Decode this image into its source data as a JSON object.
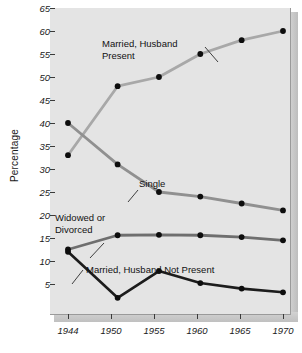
{
  "chart_data": {
    "type": "line",
    "title": "",
    "xlabel": "",
    "ylabel": "Percentage",
    "x": [
      1944,
      1950,
      1955,
      1960,
      1965,
      1970
    ],
    "xtick_labels": [
      "1944",
      "1950",
      "1955",
      "1960",
      "1965",
      "1970"
    ],
    "ytick_labels": [
      "5",
      "10",
      "15",
      "20",
      "25",
      "30",
      "35",
      "40",
      "45",
      "50",
      "55",
      "60",
      "65"
    ],
    "ylim": [
      0,
      65
    ],
    "xlim": [
      1942,
      1972
    ],
    "grid": false,
    "legend_position": "inline-annotations",
    "series": [
      {
        "name": "Married, Husband Present",
        "color": "#a8a8a8",
        "values": [
          33,
          48,
          50,
          55,
          58,
          60
        ]
      },
      {
        "name": "Single",
        "color": "#909090",
        "values": [
          40,
          31,
          25,
          24,
          22.5,
          21
        ]
      },
      {
        "name": "Widowed or Divorced",
        "color": "#6e6e6e",
        "values": [
          12.5,
          15.6,
          15.7,
          15.6,
          15.2,
          14.5
        ]
      },
      {
        "name": "Married, Husband Not Present",
        "color": "#1c1c1c",
        "values": [
          12,
          2,
          7.8,
          5.2,
          4,
          3.2
        ]
      }
    ],
    "annotations": [
      {
        "id": "ann-married-husband-present",
        "text_line1": "Married, Husband",
        "text_line2": "Present"
      },
      {
        "id": "ann-single",
        "text_line1": "Single",
        "text_line2": ""
      },
      {
        "id": "ann-widowed-or-divorced",
        "text_line1": "Widowed or",
        "text_line2": "Divorced"
      },
      {
        "id": "ann-married-husband-not-present",
        "text_line1": "Married, Husband Not Present",
        "text_line2": ""
      }
    ]
  },
  "axis": {
    "y": {
      "label": "Percentage",
      "ticks": [
        "65",
        "60",
        "55",
        "50",
        "45",
        "40",
        "35",
        "30",
        "25",
        "20",
        "15",
        "10",
        "5"
      ]
    },
    "x": {
      "ticks": [
        "1944",
        "1950",
        "1955",
        "1960",
        "1965",
        "1970"
      ]
    }
  },
  "labels": {
    "married_husband_present_l1": "Married, Husband",
    "married_husband_present_l2": "Present",
    "single": "Single",
    "widowed_or_divorced_l1": "Widowed or",
    "widowed_or_divorced_l2": "Divorced",
    "married_husband_not_present": "Married, Husband Not Present"
  }
}
